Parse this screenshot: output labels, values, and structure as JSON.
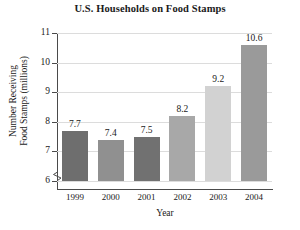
{
  "chart_data": {
    "type": "bar",
    "title": "U.S. Households on Food Stamps",
    "xlabel": "Year",
    "ylabel_lines": [
      "Number Receiving",
      "Food Stamps (millions)"
    ],
    "ylabel": "Number Receiving Food Stamps (millions)",
    "categories": [
      "1999",
      "2000",
      "2001",
      "2002",
      "2003",
      "2004"
    ],
    "values": [
      7.7,
      7.4,
      7.5,
      8.2,
      9.2,
      10.6
    ],
    "value_labels": [
      "7.7",
      "7.4",
      "7.5",
      "8.2",
      "9.2",
      "10.6"
    ],
    "ylim": [
      6,
      11
    ],
    "yticks": [
      6,
      7,
      8,
      9,
      10,
      11
    ],
    "ytick_labels": [
      "6",
      "7",
      "8",
      "9",
      "10",
      "11"
    ],
    "grid": true,
    "legend": "none",
    "axis_break": true,
    "bar_colors": [
      "#6e6e6e",
      "#909090",
      "#717171",
      "#a8a8a8",
      "#d2d2d2",
      "#9a9a9a"
    ]
  }
}
